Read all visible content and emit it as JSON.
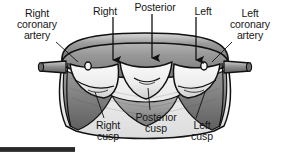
{
  "figure": {
    "type": "anatomical-illustration",
    "palette": {
      "background": "#ffffff",
      "outline": "#111111",
      "wall_light": "#f2f2f2",
      "wall_mid": "#b9b9b9",
      "wall_dark": "#8a8a8a",
      "cusp_light": "#ededed",
      "cusp_shadow": "#9c9c9c",
      "sinus_dark": "#6f6f6f",
      "text": "#161616",
      "bottom_bar": "#222222"
    }
  },
  "labels": {
    "right_coronary_artery": "Right\ncoronary\nartery",
    "right_coronary_artery_lines": [
      "Right",
      "coronary",
      "artery"
    ],
    "left_coronary_artery_lines": [
      "Left",
      "coronary",
      "artery"
    ],
    "top_right": "Right",
    "top_posterior": "Posterior",
    "top_left": "Left",
    "right_cusp_lines": [
      "Right",
      "cusp"
    ],
    "posterior_cusp_lines": [
      "Posterior",
      "cusp"
    ],
    "left_cusp_lines": [
      "Left",
      "cusp"
    ]
  },
  "annotations": {
    "arrows": [
      {
        "name": "arrow-right-cusp",
        "label": "Right",
        "x": 113,
        "y_from": 18,
        "y_to": 62
      },
      {
        "name": "arrow-posterior-cusp",
        "label": "Posterior",
        "x": 152,
        "y_from": 18,
        "y_to": 60
      },
      {
        "name": "arrow-left-cusp",
        "label": "Left",
        "x": 196,
        "y_from": 18,
        "y_to": 62
      }
    ],
    "leaders": [
      {
        "name": "leader-right-coronary",
        "from": [
          56,
          43
        ],
        "to": [
          80,
          62
        ]
      },
      {
        "name": "leader-left-coronary",
        "from": [
          232,
          43
        ],
        "to": [
          210,
          62
        ]
      },
      {
        "name": "leader-right-cusp",
        "from": [
          104,
          118
        ],
        "to": [
          94,
          92
        ]
      },
      {
        "name": "leader-posterior-cusp",
        "from": [
          150,
          110
        ],
        "to": [
          148,
          88
        ]
      },
      {
        "name": "leader-left-cusp",
        "from": [
          196,
          118
        ],
        "to": [
          205,
          92
        ]
      }
    ]
  },
  "parts": [
    {
      "name": "aortic-wall",
      "description": "Opened aortic root wall"
    },
    {
      "name": "right-cusp",
      "description": "Right semilunar cusp"
    },
    {
      "name": "posterior-cusp",
      "description": "Posterior (non-coronary) semilunar cusp"
    },
    {
      "name": "left-cusp",
      "description": "Left semilunar cusp"
    },
    {
      "name": "right-coronary-ostium",
      "description": "Right coronary artery origin"
    },
    {
      "name": "left-coronary-ostium",
      "description": "Left coronary artery origin"
    }
  ]
}
